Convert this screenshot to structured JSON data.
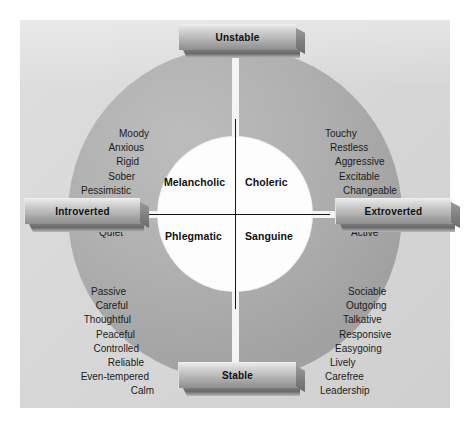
{
  "diagram": {
    "colors": {
      "panel_background": "#d9d9d9",
      "ring_fill": "#a8a8a8",
      "inner_circle": "#fdfdfd",
      "axis_line": "#141414",
      "text": "#1c1c1c",
      "banner_light": "#e9e9e9",
      "banner_dark": "#8e8e8e"
    },
    "axes": {
      "vertical_top_label": "Unstable",
      "vertical_bottom_label": "Stable",
      "horizontal_left_label": "Introverted",
      "horizontal_right_label": "Extroverted"
    },
    "quadrants": [
      {
        "id": "melancholic",
        "position": "top-left",
        "center_label": "Melancholic",
        "traits": [
          "Moody",
          "Anxious",
          "Rigid",
          "Sober",
          "Pessimistic",
          "Reserved",
          "Unsociable",
          "Quiet"
        ]
      },
      {
        "id": "choleric",
        "position": "top-right",
        "center_label": "Choleric",
        "traits": [
          "Touchy",
          "Restless",
          "Aggressive",
          "Excitable",
          "Changeable",
          "Impulsive",
          "Optimistic",
          "Active"
        ]
      },
      {
        "id": "phlegmatic",
        "position": "bottom-left",
        "center_label": "Phlegmatic",
        "traits": [
          "Passive",
          "Careful",
          "Thoughtful",
          "Peaceful",
          "Controlled",
          "Reliable",
          "Even-tempered",
          "Calm"
        ]
      },
      {
        "id": "sanguine",
        "position": "bottom-right",
        "center_label": "Sanguine",
        "traits": [
          "Sociable",
          "Outgoing",
          "Talkative",
          "Responsive",
          "Easygoing",
          "Lively",
          "Carefree",
          "Leadership"
        ]
      }
    ]
  }
}
